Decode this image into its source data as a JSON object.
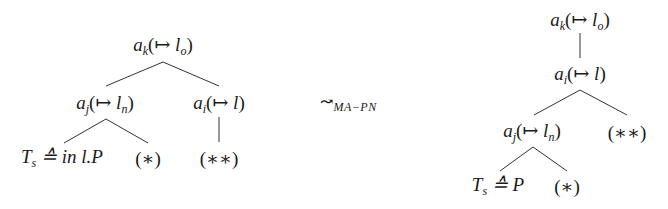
{
  "diagram": {
    "type": "tree-transformation",
    "left_tree": {
      "root": {
        "var": "a",
        "sub": "k",
        "mid": "(↦ ",
        "lvar": "l",
        "lsub": "o",
        "close": ")"
      },
      "left_child": {
        "var": "a",
        "sub": "j",
        "mid": "(↦ ",
        "lvar": "l",
        "lsub": "n",
        "close": ")"
      },
      "right_child": {
        "var": "a",
        "sub": "i",
        "mid": "(↦ ",
        "lvar": "l",
        "close": ")"
      },
      "leaf_ts": {
        "var": "T",
        "sub": "s",
        "rest": " ≙ in l.P"
      },
      "leaf_star": "(∗)",
      "leaf_dstar": "(∗∗)"
    },
    "transformation": {
      "arrow": "↝",
      "label": "MA−PN"
    },
    "right_tree": {
      "root": {
        "var": "a",
        "sub": "k",
        "mid": "(↦ ",
        "lvar": "l",
        "lsub": "o",
        "close": ")"
      },
      "middle": {
        "var": "a",
        "sub": "i",
        "mid": "(↦ ",
        "lvar": "l",
        "close": ")"
      },
      "left_child": {
        "var": "a",
        "sub": "j",
        "mid": "(↦ ",
        "lvar": "l",
        "lsub": "n",
        "close": ")"
      },
      "right_child": "(∗∗)",
      "leaf_ts": {
        "var": "T",
        "sub": "s",
        "rest": " ≙ P"
      },
      "leaf_star": "(∗)"
    }
  }
}
